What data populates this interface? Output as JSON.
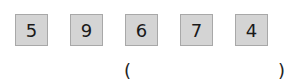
{
  "digits": [
    "5",
    "9",
    "6",
    "7",
    "4"
  ],
  "answer": {
    "open": "(",
    "close": ")",
    "value": ""
  }
}
